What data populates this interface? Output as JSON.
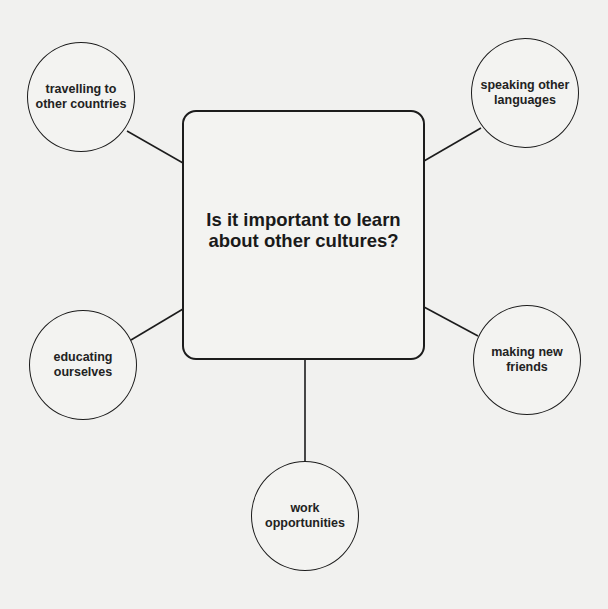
{
  "diagram": {
    "type": "mind-map",
    "central_topic": {
      "line1": "Is it important to learn",
      "line2": "about other cultures?"
    },
    "nodes": [
      {
        "id": "travelling",
        "label": "travelling to\nother countries",
        "position": "top-left"
      },
      {
        "id": "speaking",
        "label": "speaking other\nlanguages",
        "position": "top-right"
      },
      {
        "id": "educating",
        "label": "educating\nourselves",
        "position": "bottom-left"
      },
      {
        "id": "friends",
        "label": "making new\nfriends",
        "position": "bottom-right"
      },
      {
        "id": "work",
        "label": "work\nopportunities",
        "position": "bottom"
      }
    ],
    "colors": {
      "background": "#f1f1ef",
      "stroke": "#1c1c1c",
      "text": "#1a1a1a"
    }
  }
}
